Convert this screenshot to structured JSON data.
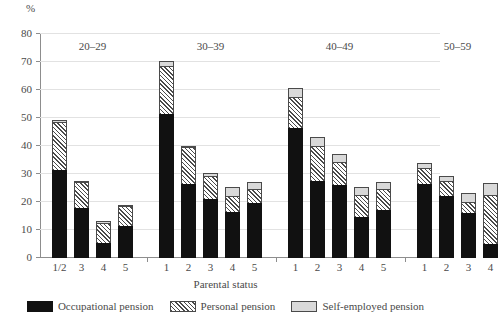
{
  "chart_data": {
    "type": "bar",
    "stacked": true,
    "title": "",
    "xlabel": "Parental status",
    "ylabel": "%",
    "ylim": [
      0,
      80
    ],
    "yticks": [
      0,
      10,
      20,
      30,
      40,
      50,
      60,
      70,
      80
    ],
    "grid": true,
    "legend_position": "bottom",
    "group_label_name": "Age group",
    "groups": [
      {
        "label": "20–29",
        "categories": [
          "1/2",
          "3",
          "4",
          "5"
        ],
        "series": [
          {
            "name": "Occupational pension",
            "values": [
              31.5,
              18.0,
              5.5,
              11.5
            ]
          },
          {
            "name": "Personal pension",
            "values": [
              17.5,
              9.5,
              7.5,
              7.5
            ]
          },
          {
            "name": "Self-employed pension",
            "values": [
              1.0,
              0.5,
              1.0,
              0.5
            ]
          }
        ],
        "totals": [
          50.0,
          28.0,
          14.0,
          19.5
        ]
      },
      {
        "label": "30–39",
        "categories": [
          "1",
          "2",
          "3",
          "4",
          "5"
        ],
        "series": [
          {
            "name": "Occupational pension",
            "values": [
              51.5,
              26.5,
              21.0,
              16.5,
              19.5
            ]
          },
          {
            "name": "Personal pension",
            "values": [
              17.5,
              13.5,
              8.5,
              6.0,
              5.5
            ]
          },
          {
            "name": "Self-employed pension",
            "values": [
              2.0,
              0.5,
              1.5,
              3.5,
              3.0
            ]
          }
        ],
        "totals": [
          71.0,
          40.5,
          31.0,
          26.0,
          28.0
        ]
      },
      {
        "label": "40–49",
        "categories": [
          "1",
          "2",
          "3",
          "4",
          "5"
        ],
        "series": [
          {
            "name": "Occupational pension",
            "values": [
              46.5,
              27.5,
              26.0,
              14.5,
              17.0
            ]
          },
          {
            "name": "Personal pension",
            "values": [
              11.5,
              13.0,
              8.5,
              8.5,
              8.0
            ]
          },
          {
            "name": "Self-employed pension",
            "values": [
              3.5,
              3.5,
              3.5,
              3.0,
              3.0
            ]
          }
        ],
        "totals": [
          61.5,
          44.0,
          38.0,
          26.0,
          28.0
        ]
      },
      {
        "label": "50–59",
        "categories": [
          "1",
          "2",
          "3",
          "4"
        ],
        "series": [
          {
            "name": "Occupational pension",
            "values": [
              26.5,
              22.0,
              16.0,
              5.0
            ]
          },
          {
            "name": "Personal pension",
            "values": [
              6.0,
              6.0,
              4.5,
              18.0
            ]
          },
          {
            "name": "Self-employed pension",
            "values": [
              2.0,
              2.0,
              3.5,
              4.5
            ]
          }
        ],
        "totals": [
          34.5,
          30.0,
          24.0,
          27.5
        ]
      }
    ],
    "legend": [
      {
        "key": "occ",
        "label": "Occupational pension",
        "color": "#111111"
      },
      {
        "key": "pers",
        "label": "Personal pension",
        "color": "#ffffff"
      },
      {
        "key": "self",
        "label": "Self-employed pension",
        "color": "#d9d9d9"
      }
    ]
  }
}
